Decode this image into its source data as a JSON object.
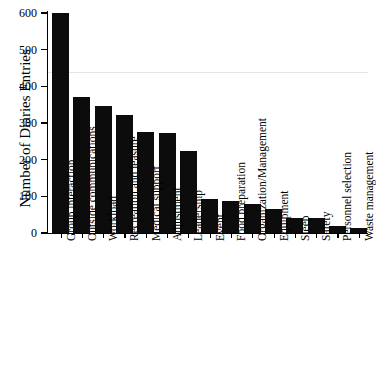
{
  "chart_data": {
    "type": "bar",
    "title": "",
    "subtitle": "",
    "xlabel": "",
    "ylabel": "Number of Diaries Entries",
    "ylim": [
      0,
      600
    ],
    "yticks": [
      0,
      100,
      200,
      300,
      400,
      500,
      600
    ],
    "ytick_labels": [
      "0",
      "100",
      "200",
      "300",
      "400",
      "500",
      "600"
    ],
    "grid": false,
    "legend": null,
    "bar_color": "#0d0c0c",
    "categories": [
      "Group interaction",
      "Outside communications",
      "Workload",
      "Recreation and leasure",
      "Medical support",
      "Adjustment",
      "Leadership",
      "Event",
      "Food preparation",
      "Organization/Management",
      "Equipment",
      "Sleep",
      "Safety",
      "Personnel selection",
      "Waste management"
    ],
    "values": [
      600,
      372,
      346,
      322,
      275,
      272,
      225,
      93,
      88,
      80,
      65,
      42,
      40,
      20,
      13
    ]
  }
}
